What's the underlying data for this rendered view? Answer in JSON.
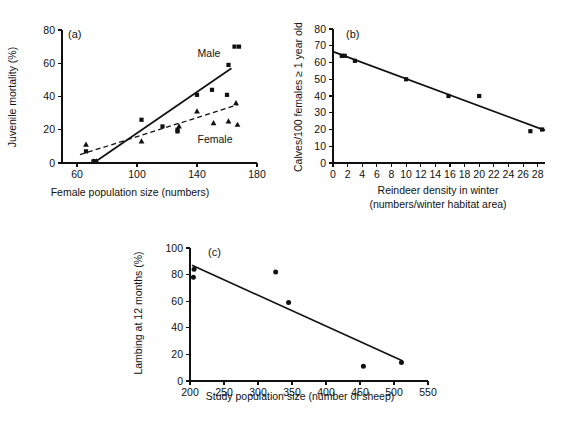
{
  "figure": {
    "background": "#ffffff",
    "ink": "#111111"
  },
  "panels": {
    "a": {
      "tag": "(a)",
      "xlabel": "Female population size (numbers)",
      "ylabel": "Juvenile mortality (%)",
      "series_labels": {
        "male": "Male",
        "female": "Female"
      },
      "xticks": [
        "60",
        "100",
        "140",
        "180"
      ],
      "yticks": [
        "0",
        "20",
        "40",
        "60",
        "80"
      ]
    },
    "b": {
      "tag": "(b)",
      "xlabel_line1": "Reindeer density in winter",
      "xlabel_line2": "(numbers/winter habitat area)",
      "ylabel": "Calves/100 females ≥ 1 year old",
      "xticks": [
        "0",
        "2",
        "4",
        "6",
        "8",
        "10",
        "12",
        "14",
        "16",
        "18",
        "20",
        "22",
        "24",
        "26",
        "28"
      ],
      "yticks": [
        "0",
        "10",
        "20",
        "30",
        "40",
        "50",
        "60",
        "70",
        "80"
      ]
    },
    "c": {
      "tag": "(c)",
      "xlabel": "Study population size (number of sheep)",
      "ylabel": "Lambing at 12 months (%)",
      "xticks": [
        "200",
        "250",
        "300",
        "350",
        "400",
        "450",
        "500",
        "550"
      ],
      "yticks": [
        "0",
        "20",
        "40",
        "60",
        "80",
        "100"
      ]
    }
  },
  "chart_data": [
    {
      "type": "scatter",
      "panel": "a",
      "title": "(a)",
      "xlabel": "Female population size (numbers)",
      "ylabel": "Juvenile mortality (%)",
      "xlim": [
        50,
        180
      ],
      "ylim": [
        0,
        80
      ],
      "xticks": [
        60,
        100,
        140,
        180
      ],
      "yticks": [
        0,
        20,
        40,
        60,
        80
      ],
      "grid": false,
      "legend": "inline-annotations",
      "series": [
        {
          "name": "Male",
          "marker": "square",
          "points": [
            [
              66,
              7
            ],
            [
              71,
              1
            ],
            [
              72,
              1
            ],
            [
              103,
              26
            ],
            [
              117,
              22
            ],
            [
              127,
              20
            ],
            [
              127,
              19
            ],
            [
              140,
              41
            ],
            [
              150,
              44
            ],
            [
              160,
              41
            ],
            [
              161,
              59
            ],
            [
              165,
              70
            ],
            [
              168,
              70
            ]
          ],
          "fit": {
            "style": "solid",
            "x0": 71,
            "y0": 0,
            "x1": 163,
            "y1": 57
          }
        },
        {
          "name": "Female",
          "marker": "triangle",
          "points": [
            [
              66,
              11
            ],
            [
              71,
              1
            ],
            [
              73,
              1
            ],
            [
              103,
              13
            ],
            [
              128,
              22
            ],
            [
              140,
              31
            ],
            [
              151,
              24
            ],
            [
              161,
              25
            ],
            [
              166,
              36
            ],
            [
              167,
              23
            ]
          ],
          "fit": {
            "style": "dashed",
            "x0": 62,
            "y0": 5,
            "x1": 167,
            "y1": 35
          }
        }
      ],
      "annotations": [
        {
          "text": "Male",
          "x": 148,
          "y": 64
        },
        {
          "text": "Female",
          "x": 152,
          "y": 12
        }
      ]
    },
    {
      "type": "scatter",
      "panel": "b",
      "title": "(b)",
      "xlabel": "Reindeer density in winter (numbers/winter habitat area)",
      "ylabel": "Calves/100 females ≥ 1 year old",
      "xlim": [
        0,
        29
      ],
      "ylim": [
        0,
        80
      ],
      "xticks": [
        0,
        2,
        4,
        6,
        8,
        10,
        12,
        14,
        16,
        18,
        20,
        22,
        24,
        26,
        28
      ],
      "yticks": [
        0,
        10,
        20,
        30,
        40,
        50,
        60,
        70,
        80
      ],
      "grid": false,
      "marker": "square",
      "points": [
        [
          1.2,
          64
        ],
        [
          1.6,
          64
        ],
        [
          3.0,
          61
        ],
        [
          10.0,
          50
        ],
        [
          15.8,
          40
        ],
        [
          20.0,
          40
        ],
        [
          27.0,
          19
        ],
        [
          28.6,
          20
        ]
      ],
      "fit": {
        "style": "solid",
        "x0": 0,
        "y0": 66.5,
        "x1": 29,
        "y1": 19.5
      }
    },
    {
      "type": "scatter",
      "panel": "c",
      "title": "(c)",
      "xlabel": "Study population size (number of sheep)",
      "ylabel": "Lambing at 12 months (%)",
      "xlim": [
        200,
        550
      ],
      "ylim": [
        0,
        100
      ],
      "xticks": [
        200,
        250,
        300,
        350,
        400,
        450,
        500,
        550
      ],
      "yticks": [
        0,
        20,
        40,
        60,
        80,
        100
      ],
      "grid": false,
      "marker": "circle",
      "points": [
        [
          206,
          84
        ],
        [
          205,
          78
        ],
        [
          326,
          82
        ],
        [
          345,
          59
        ],
        [
          455,
          11
        ],
        [
          511,
          14
        ]
      ],
      "fit": {
        "style": "solid",
        "x0": 203,
        "y0": 87,
        "x1": 513,
        "y1": 15
      }
    }
  ]
}
